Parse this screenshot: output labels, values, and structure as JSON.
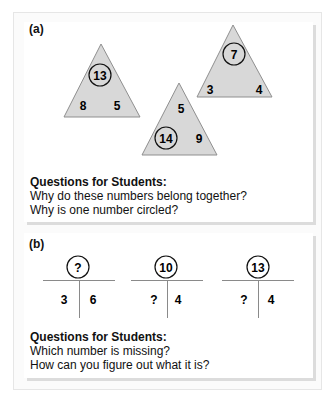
{
  "panel_a": {
    "label": "(a)",
    "triangles": [
      {
        "circled": "13",
        "left": "8",
        "right": "5"
      },
      {
        "top": "5",
        "circled": "14",
        "right": "9"
      },
      {
        "circled": "7",
        "left": "3",
        "right": "4"
      }
    ],
    "questions_title": "Questions for Students:",
    "questions": [
      "Why do these numbers belong together?",
      "Why is one number circled?"
    ]
  },
  "panel_b": {
    "label": "(b)",
    "t_charts": [
      {
        "total": "?",
        "left": "3",
        "right": "6"
      },
      {
        "total": "10",
        "left": "?",
        "right": "4"
      },
      {
        "total": "13",
        "left": "?",
        "right": "4"
      }
    ],
    "questions_title": "Questions for Students:",
    "questions": [
      "Which number is missing?",
      "How can you figure out what it is?"
    ]
  },
  "colors": {
    "triangle_fill": "#d8d8d8",
    "triangle_stroke": "#8f8f8f",
    "line": "#8a8a8a"
  }
}
